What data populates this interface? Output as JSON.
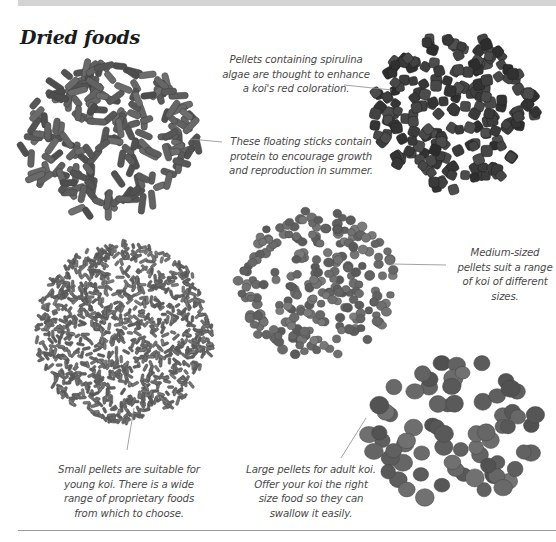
{
  "page": {
    "heading": "Dried foods"
  },
  "items": [
    {
      "id": "floating-sticks",
      "image_label": "Floating sticks",
      "caption": "These floating sticks contain protein to encourage growth and reproduction in summer.",
      "color": "#5e5e5e"
    },
    {
      "id": "spirulina-pellets",
      "image_label": "Spirulina algae pellets",
      "caption": "Pellets containing spirulina algae are thought to enhance a koi's red coloration.",
      "color": "#3e3e3e"
    },
    {
      "id": "medium-pellets",
      "image_label": "Medium-sized pellets",
      "caption": "Medium-sized pellets suit a range of koi of different sizes.",
      "color": "#6a6a6a"
    },
    {
      "id": "small-pellets",
      "image_label": "Small pellets",
      "caption": "Small pellets are suitable for young koi. There is a wide range of proprietary foods from which to choose.",
      "color": "#6c6c6c"
    },
    {
      "id": "large-pellets",
      "image_label": "Large pellets",
      "caption": "Large pellets for adult koi. Offer your koi the right size food so they can swallow it easily.",
      "color": "#626262"
    }
  ],
  "colors": {
    "band": "#d4d4d4",
    "caption_text": "#4a4a4a",
    "heading_text": "#1b1b1b",
    "leader_line": "#8a8a8a"
  }
}
